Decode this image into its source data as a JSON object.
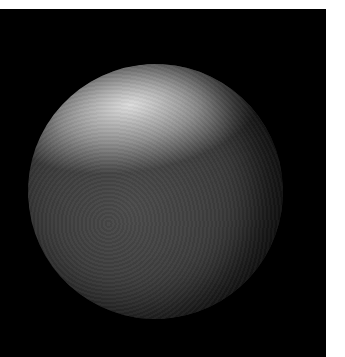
{
  "image": {
    "subject": "moon-iapetus",
    "description": "Cratered moon with a bright upper region and a dark lower region, on a black background",
    "colors": {
      "background": "#000000",
      "page": "#ffffff",
      "bright_region": "#e6e6e6",
      "dark_region": "#3a3a3a"
    }
  }
}
